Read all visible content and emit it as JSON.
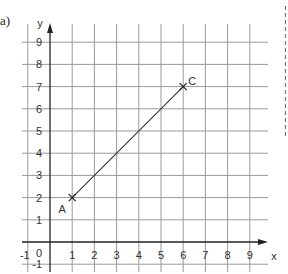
{
  "part_label": "a)",
  "axes": {
    "x_label": "x",
    "y_label": "y",
    "origin_label": "0",
    "x_ticks": [
      "-1",
      "1",
      "2",
      "3",
      "4",
      "5",
      "6",
      "7",
      "8",
      "9"
    ],
    "y_ticks": [
      "9",
      "8",
      "7",
      "6",
      "5",
      "4",
      "3",
      "2",
      "1",
      "-1"
    ]
  },
  "points": [
    {
      "name": "A",
      "x": 1,
      "y": 2
    },
    {
      "name": "C",
      "x": 6,
      "y": 7
    }
  ],
  "segment": {
    "from": "A",
    "to": "C"
  },
  "colors": {
    "grid": "#9a9a9a",
    "axis": "#222222",
    "line": "#333333",
    "dash": "#777777"
  }
}
